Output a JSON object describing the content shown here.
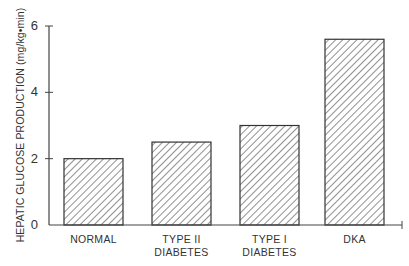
{
  "chart_data": {
    "type": "bar",
    "title": "",
    "xlabel": "",
    "ylabel": "HEPATIC GLUCOSE PRODUCTION (mg/kg•min)",
    "categories": [
      "NORMAL",
      "TYPE II DIABETES",
      "TYPE I DIABETES",
      "DKA"
    ],
    "category_lines": [
      [
        "NORMAL"
      ],
      [
        "TYPE II",
        "DIABETES"
      ],
      [
        "TYPE I",
        "DIABETES"
      ],
      [
        "DKA"
      ]
    ],
    "values": [
      2.0,
      2.5,
      3.0,
      5.6
    ],
    "ylim": [
      0,
      6
    ],
    "yticks": [
      0,
      2,
      4,
      6
    ],
    "grid": false,
    "legend": null,
    "bar_fill": "diagonal-hatch",
    "colors": {
      "stroke": "#333333",
      "hatch": "#555555",
      "background": "#ffffff"
    }
  }
}
